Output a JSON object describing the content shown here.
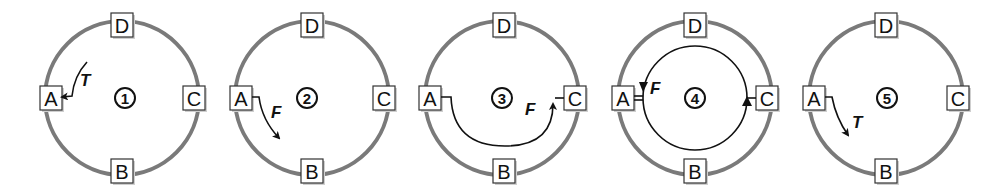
{
  "figure": {
    "colors": {
      "ring": "#7a7a7a",
      "ink": "#111111",
      "box_fill": "#ffffff"
    },
    "panels": [
      {
        "step": "1",
        "nodes": {
          "top": "D",
          "left": "A",
          "right": "C",
          "bottom": "B"
        },
        "arrow_label": "T",
        "arrow_desc": "token arriving at A"
      },
      {
        "step": "2",
        "nodes": {
          "top": "D",
          "left": "A",
          "right": "C",
          "bottom": "B"
        },
        "arrow_label": "F",
        "arrow_desc": "frame sent from A toward B"
      },
      {
        "step": "3",
        "nodes": {
          "top": "D",
          "left": "A",
          "right": "C",
          "bottom": "B"
        },
        "arrow_label": "F",
        "arrow_desc": "frame travels from A through B to C"
      },
      {
        "step": "4",
        "nodes": {
          "top": "D",
          "left": "A",
          "right": "C",
          "bottom": "B"
        },
        "arrow_label": "F",
        "arrow_desc": "frame circulates from C around back to A"
      },
      {
        "step": "5",
        "nodes": {
          "top": "D",
          "left": "A",
          "right": "C",
          "bottom": "B"
        },
        "arrow_label": "T",
        "arrow_desc": "token released from A toward B"
      }
    ]
  }
}
